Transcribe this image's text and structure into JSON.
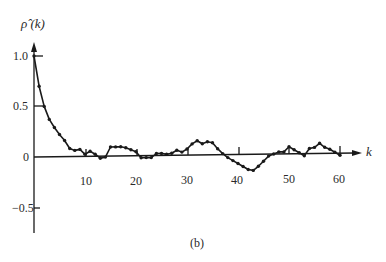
{
  "chart_data": {
    "type": "line",
    "title": "",
    "caption": "(b)",
    "xlabel": "k",
    "ylabel": "ρ̂ (k)",
    "ylabel_text": "ρ̂ (k)",
    "xlim": [
      0,
      62
    ],
    "ylim": [
      -0.7,
      1.15
    ],
    "x_ticks": [
      10,
      20,
      30,
      40,
      50,
      60
    ],
    "x_tick_labels": [
      "10",
      "20",
      "30",
      "40",
      "50",
      "60"
    ],
    "y_ticks": [
      1.0,
      0.5,
      0,
      -0.5
    ],
    "y_tick_labels": [
      "1.0",
      "0.5",
      "0",
      "−0.5"
    ],
    "grid": false,
    "legend": null,
    "series": [
      {
        "name": "sample autocorrelation",
        "x": [
          0,
          1,
          2,
          3,
          4,
          5,
          6,
          7,
          8,
          9,
          10,
          11,
          12,
          13,
          14,
          15,
          16,
          17,
          18,
          19,
          20,
          21,
          22,
          23,
          24,
          25,
          26,
          27,
          28,
          29,
          30,
          31,
          32,
          33,
          34,
          35,
          36,
          37,
          38,
          39,
          40,
          41,
          42,
          43,
          44,
          45,
          46,
          47,
          48,
          49,
          50,
          51,
          52,
          53,
          54,
          55,
          56,
          57,
          58,
          59,
          60
        ],
        "values": [
          1.0,
          0.7,
          0.5,
          0.37,
          0.29,
          0.22,
          0.16,
          0.08,
          0.06,
          0.07,
          0.02,
          0.05,
          0.02,
          -0.02,
          -0.01,
          0.09,
          0.09,
          0.09,
          0.08,
          0.06,
          0.04,
          -0.02,
          -0.02,
          -0.02,
          0.02,
          0.02,
          0.01,
          0.02,
          0.05,
          0.03,
          0.06,
          0.11,
          0.14,
          0.11,
          0.13,
          0.12,
          0.06,
          0.01,
          -0.03,
          -0.06,
          -0.09,
          -0.12,
          -0.15,
          -0.16,
          -0.12,
          -0.07,
          -0.02,
          0.0,
          0.02,
          0.02,
          0.07,
          0.04,
          0.01,
          -0.02,
          0.05,
          0.06,
          0.1,
          0.06,
          0.04,
          0.01,
          -0.02
        ]
      }
    ]
  },
  "labels": {
    "ylabel": "ρ̂ (k)",
    "xlabel": "k",
    "caption": "(b)",
    "y_1": "1.0",
    "y_05": "0.5",
    "y_0": "0",
    "y_m05": "−0.5",
    "x_10": "10",
    "x_20": "20",
    "x_30": "30",
    "x_40": "40",
    "x_50": "50",
    "x_60": "60"
  },
  "style": {
    "ink": "#1a1a1a",
    "background": "#ffffff"
  }
}
